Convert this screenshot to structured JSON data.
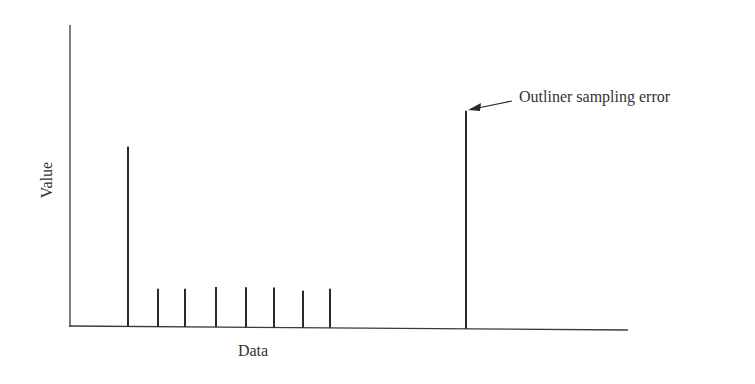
{
  "chart_data": {
    "type": "bar",
    "style": "stem",
    "title": "",
    "xlabel": "Data",
    "ylabel": "Value",
    "grid": false,
    "legend": null,
    "ticks": {
      "x": [],
      "y": []
    },
    "x": [
      128,
      158,
      185,
      216,
      246,
      274,
      303,
      330,
      466
    ],
    "values": [
      180,
      38,
      38,
      40,
      40,
      40,
      37,
      39,
      218
    ],
    "ylim": [
      0,
      302
    ],
    "xlim": [
      70,
      628
    ],
    "annotations": [
      {
        "text": "Outliner sampling error",
        "target_index": 8,
        "arrow": true
      }
    ]
  },
  "labels": {
    "xlabel": "Data",
    "ylabel": "Value",
    "annotation": "Outliner sampling error"
  },
  "colors": {
    "line": "#2a2a2a",
    "axis": "#3a3a3a"
  }
}
